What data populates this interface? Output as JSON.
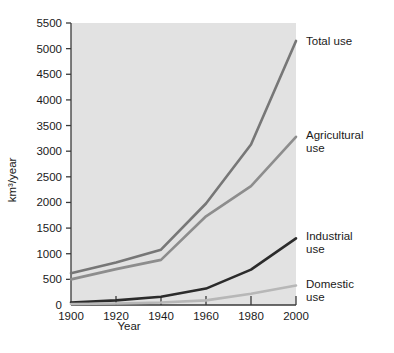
{
  "figure": {
    "name": "global-water-use-line-chart",
    "background": "#ffffff",
    "plot_background": "#e2e2e2"
  },
  "chart_data": {
    "type": "line",
    "title": "",
    "subtitle": "",
    "xlabel": "Year",
    "ylabel": "km³/year",
    "xlim": [
      1900,
      2000
    ],
    "ylim": [
      0,
      5500
    ],
    "xticks": [
      1900,
      1920,
      1940,
      1960,
      1980,
      2000
    ],
    "xtick_labels": [
      "1900",
      "1920",
      "1940",
      "1960",
      "1980",
      "2000"
    ],
    "yticks": [
      0,
      500,
      1000,
      1500,
      2000,
      2500,
      3000,
      3500,
      4000,
      4500,
      5000,
      5500
    ],
    "ytick_labels": [
      "0",
      "500",
      "1000",
      "1500",
      "2000",
      "2500",
      "3000",
      "3500",
      "4000",
      "4500",
      "5000",
      "5500"
    ],
    "grid": false,
    "legend_position": "right-inline",
    "x": [
      1900,
      1920,
      1940,
      1960,
      1980,
      2000
    ],
    "series": [
      {
        "name": "Total use",
        "label": "Total use",
        "color": "#777777",
        "width": 2.6,
        "values": [
          620,
          830,
          1080,
          1980,
          3130,
          5150
        ]
      },
      {
        "name": "Agricultural use",
        "label": "Agricultural\nuse",
        "label_line1": "Agricultural",
        "label_line2": "use",
        "color": "#8d8d8d",
        "width": 2.6,
        "values": [
          500,
          700,
          880,
          1730,
          2320,
          3280
        ]
      },
      {
        "name": "Industrial use",
        "label": "Industrial\nuse",
        "label_line1": "Industrial",
        "label_line2": "use",
        "color": "#2b2b2b",
        "width": 2.6,
        "values": [
          50,
          90,
          160,
          320,
          690,
          1300
        ]
      },
      {
        "name": "Domestic use",
        "label": "Domestic\nuse",
        "label_line1": "Domestic",
        "label_line2": "use",
        "color": "#b7b7b7",
        "width": 2.6,
        "values": [
          20,
          30,
          50,
          90,
          220,
          380
        ]
      }
    ],
    "annotations": [
      {
        "text": "Total use",
        "series": "Total use"
      },
      {
        "text": "Agricultural use",
        "series": "Agricultural use"
      },
      {
        "text": "Industrial use",
        "series": "Industrial use"
      },
      {
        "text": "Domestic use",
        "series": "Domestic use"
      }
    ]
  }
}
